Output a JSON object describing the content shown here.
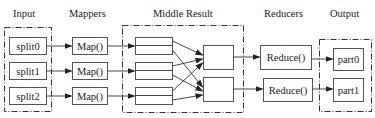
{
  "diagram": {
    "title_labels": {
      "input": "Input",
      "mappers": "Mappers",
      "middle": "Middle Result",
      "reducers": "Reducers",
      "output": "Output"
    },
    "inputs": [
      "split0",
      "split1",
      "split2"
    ],
    "mappers": [
      "Map()",
      "Map()",
      "Map()"
    ],
    "reducers": [
      "Reduce()",
      "Reduce()"
    ],
    "outputs": [
      "part0",
      "part1"
    ],
    "colors": {
      "stroke": "#555555",
      "text": "#222222",
      "background": "#ffffff"
    }
  }
}
